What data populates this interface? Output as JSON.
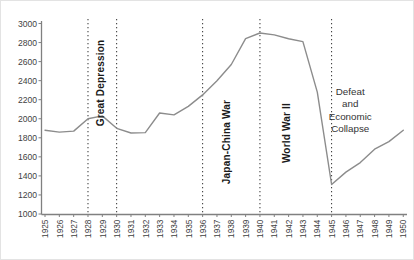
{
  "chart_data": {
    "type": "line",
    "title": "",
    "xlabel": "",
    "ylabel": "",
    "x": [
      1925,
      1926,
      1927,
      1928,
      1929,
      1930,
      1931,
      1932,
      1933,
      1934,
      1935,
      1936,
      1937,
      1938,
      1939,
      1940,
      1941,
      1942,
      1943,
      1944,
      1945,
      1946,
      1947,
      1948,
      1949,
      1950
    ],
    "series": [
      {
        "name": "index",
        "values": [
          1880,
          1860,
          1870,
          2000,
          2030,
          1900,
          1850,
          1855,
          2060,
          2040,
          2130,
          2250,
          2400,
          2570,
          2840,
          2900,
          2880,
          2840,
          2810,
          2280,
          1310,
          1440,
          1540,
          1680,
          1760,
          1880
        ]
      }
    ],
    "ylim": [
      1000,
      3000
    ],
    "ytick_step": 200,
    "yticks": [
      1000,
      1200,
      1400,
      1600,
      1800,
      2000,
      2200,
      2400,
      2600,
      2800,
      3000
    ],
    "grid": false,
    "legend": false,
    "line_color": "#8c8c8c",
    "axis_color": "#808080",
    "tick_label_color": "#3f3f3f",
    "annotation_color": "#1a1a1a",
    "annotations": {
      "vlines": [
        1928,
        1930,
        1936,
        1940,
        1945
      ],
      "vline_style": "dotted",
      "labels": [
        {
          "id": "great-depression",
          "text": "Great Depression",
          "orientation": "vertical",
          "bold": true,
          "year": 1929.1,
          "cy_px": 82
        },
        {
          "id": "japan-china-war",
          "text": "Japan-China War",
          "orientation": "vertical",
          "bold": true,
          "year": 1937.9,
          "cy_px": 141
        },
        {
          "id": "world-war-ii",
          "text": "World War II",
          "orientation": "vertical",
          "bold": true,
          "year": 1942.1,
          "cy_px": 132
        },
        {
          "id": "defeat-economic-collapse",
          "text": "Defeat and Economic Collapse",
          "lines": [
            "Defeat",
            "and",
            "Economic",
            "Collapse"
          ],
          "orientation": "horizontal",
          "bold": false,
          "year": 1946.3,
          "cy_px": 109
        }
      ]
    }
  }
}
